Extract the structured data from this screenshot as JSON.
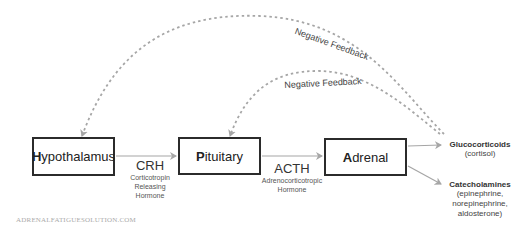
{
  "diagram": {
    "nodes": [
      {
        "id": "hypothalamus",
        "first_letter": "H",
        "rest": "ypothalamus"
      },
      {
        "id": "pituitary",
        "first_letter": "P",
        "rest": "ituitary"
      },
      {
        "id": "adrenal",
        "first_letter": "A",
        "rest": "drenal"
      }
    ],
    "hormones": [
      {
        "abbr": "CRH",
        "lines": [
          "Corticotropin",
          "Releasing",
          "Hormone"
        ]
      },
      {
        "abbr": "ACTH",
        "lines": [
          "Adrenocorticotropic",
          "Hormone"
        ]
      }
    ],
    "outputs": [
      {
        "title": "Glucocorticoids",
        "lines": [
          "(cortisol)"
        ]
      },
      {
        "title": "Catecholamines",
        "lines": [
          "(epinephrine,",
          "norepinephrine,",
          "aldosterone)"
        ]
      }
    ],
    "feedback_labels": [
      "Negative Feedback",
      "Negative Feedback"
    ],
    "colors": {
      "arrow": "#a6a6a6",
      "box_border": "#2b2b2b",
      "text": "#333333"
    }
  },
  "watermark": "ADRENALFATIGUESOLUTION.COM"
}
